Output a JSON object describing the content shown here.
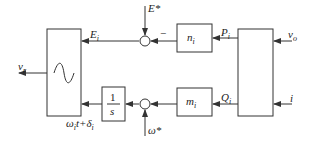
{
  "diagram": {
    "type": "block-diagram",
    "blocks": {
      "sine": {
        "label": "~"
      },
      "n": {
        "label": "n",
        "sub": "i"
      },
      "m": {
        "label": "m",
        "sub": "i"
      },
      "integrator": {
        "num": "1",
        "den": "s"
      },
      "power_calc": {
        "label": ""
      }
    },
    "signals": {
      "E_star": "E*",
      "omega_star": "ω*",
      "E_i": {
        "label": "E",
        "sub": "i"
      },
      "P_i": {
        "label": "P",
        "sub": "i"
      },
      "Q_i": {
        "label": "Q",
        "sub": "i"
      },
      "v_o": {
        "label": "v",
        "sub": "o"
      },
      "i": "i",
      "v_r": {
        "label": "v",
        "sub": "r"
      },
      "phase": {
        "a": "ω",
        "a_sub": "i",
        "b": "t+δ",
        "b_sub": "i"
      },
      "minus_sign": "−"
    },
    "colors": {
      "line": "#333333",
      "background": "#ffffff"
    }
  }
}
